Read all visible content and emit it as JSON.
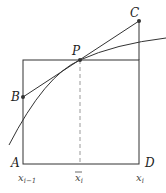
{
  "diagram": {
    "points": {
      "A": {
        "label": "A"
      },
      "B": {
        "label": "B"
      },
      "C": {
        "label": "C"
      },
      "D": {
        "label": "D"
      },
      "P": {
        "label": "P"
      }
    },
    "axis_labels": {
      "left": "x",
      "left_sub": "i−1",
      "mid": "x",
      "mid_sub": "i",
      "right": "x",
      "right_sub": "i"
    },
    "colors": {
      "stroke": "#333333",
      "dashed": "#888888"
    }
  }
}
